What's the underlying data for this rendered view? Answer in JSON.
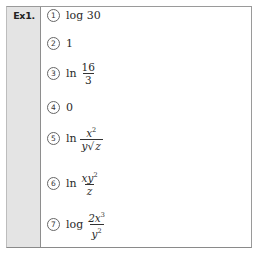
{
  "label": "Ex1.",
  "answers": [
    {
      "marker": "1",
      "text": "log 30"
    },
    {
      "marker": "2",
      "text": "1"
    },
    {
      "marker": "3",
      "fn": "ln",
      "numerator": "16",
      "denominator": "3"
    },
    {
      "marker": "4",
      "text": "0"
    },
    {
      "marker": "5",
      "fn": "ln",
      "numerator_base": "x",
      "numerator_exp": "2",
      "denominator_pre": "y",
      "denominator_radical": "z"
    },
    {
      "marker": "6",
      "fn": "ln",
      "numerator_base": "xy",
      "numerator_exp": "2",
      "denominator": "z"
    },
    {
      "marker": "7",
      "fn": "log",
      "numerator_base": "2x",
      "numerator_exp": "3",
      "denominator_base": "y",
      "denominator_exp": "2"
    }
  ],
  "colors": {
    "label_bg": "#e4e4e4",
    "border": "#8e8e8e",
    "text": "#2a2a2a"
  }
}
